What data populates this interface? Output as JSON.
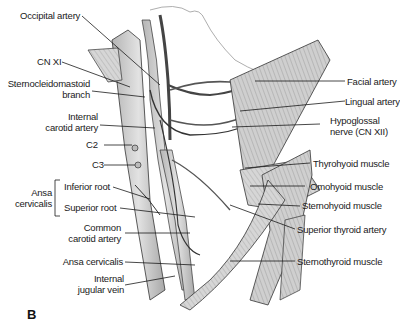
{
  "figure": {
    "panel_label": "B",
    "labels_left": [
      {
        "id": "occipital-artery",
        "text": "Occipital artery"
      },
      {
        "id": "cn-xi",
        "text": "CN XI"
      },
      {
        "id": "scm-branch-1",
        "text": "Sternocleidomastoid"
      },
      {
        "id": "scm-branch-2",
        "text": "branch"
      },
      {
        "id": "ica-1",
        "text": "Internal"
      },
      {
        "id": "ica-2",
        "text": "carotid artery"
      },
      {
        "id": "c2",
        "text": "C2"
      },
      {
        "id": "c3",
        "text": "C3"
      },
      {
        "id": "ansa-group-1",
        "text": "Ansa"
      },
      {
        "id": "ansa-group-2",
        "text": "cervicalis"
      },
      {
        "id": "inferior-root",
        "text": "Inferior root"
      },
      {
        "id": "superior-root",
        "text": "Superior root"
      },
      {
        "id": "cca-1",
        "text": "Common"
      },
      {
        "id": "cca-2",
        "text": "carotid artery"
      },
      {
        "id": "ansa-cervicalis",
        "text": "Ansa cervicalis"
      },
      {
        "id": "ijv-1",
        "text": "Internal"
      },
      {
        "id": "ijv-2",
        "text": "jugular vein"
      }
    ],
    "labels_right": [
      {
        "id": "facial-artery",
        "text": "Facial artery"
      },
      {
        "id": "lingual-artery",
        "text": "Lingual artery"
      },
      {
        "id": "hypoglossal-1",
        "text": "Hypoglossal"
      },
      {
        "id": "hypoglossal-2",
        "text": "nerve (CN XII)"
      },
      {
        "id": "thyrohyoid",
        "text": "Thyrohyoid muscle"
      },
      {
        "id": "omohyoid",
        "text": "Omohyoid muscle"
      },
      {
        "id": "sternohyoid",
        "text": "Sternohyoid muscle"
      },
      {
        "id": "superior-thyroid",
        "text": "Superior thyroid artery"
      },
      {
        "id": "sternothyroid",
        "text": "Sternothyroid muscle"
      }
    ],
    "colors": {
      "ink": "#1a1a1a",
      "vessel_fill": "#d4d4d4",
      "muscle_fill": "#c8c8c8",
      "background": "#ffffff"
    }
  }
}
